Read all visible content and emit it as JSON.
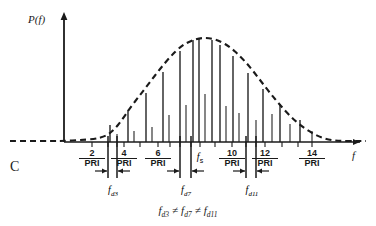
{
  "figure": {
    "panel_label": "C",
    "axis": {
      "y_label": "P(f)",
      "x_label": "f"
    },
    "center_tick": {
      "symbol": "f",
      "subscript": "s"
    },
    "equation": {
      "term1": "f",
      "term1_sub": "d3",
      "op1": "≠",
      "term2": "f",
      "term2_sub": "d7",
      "op2": "≠",
      "term3": "f",
      "term3_sub": "d11"
    },
    "tick_labels": [
      {
        "numerator": "2",
        "denominator": "PRI",
        "x": 92
      },
      {
        "numerator": "4",
        "denominator": "PRI",
        "x": 124
      },
      {
        "numerator": "6",
        "denominator": "PRI",
        "x": 158
      },
      {
        "numerator": "10",
        "denominator": "PRI",
        "x": 232
      },
      {
        "numerator": "12",
        "denominator": "PRI",
        "x": 265
      },
      {
        "numerator": "14",
        "denominator": "PRI",
        "x": 312
      }
    ],
    "doppler_markers": [
      {
        "label": "f",
        "sub": "d3",
        "x": 113,
        "left_rule": 108,
        "right_rule": 117
      },
      {
        "label": "f",
        "sub": "d7",
        "x": 186,
        "left_rule": 180,
        "right_rule": 191
      },
      {
        "label": "f",
        "sub": "d11",
        "x": 252,
        "left_rule": 246,
        "right_rule": 256
      }
    ],
    "colors": {
      "ink": "#1a1a1a",
      "background": "#ffffff"
    }
  },
  "chart_data": {
    "type": "line",
    "title": "",
    "subtitle": "",
    "xlabel": "f",
    "ylabel": "P(f)",
    "grid": false,
    "legend": null,
    "axis_origin_px": {
      "x": 64,
      "y": 142
    },
    "baseline_y_px": 142,
    "xlim_px": [
      10,
      366
    ],
    "ylim_px": [
      14,
      142
    ],
    "envelope": {
      "style": "dashed",
      "points": [
        [
          10,
          141
        ],
        [
          30,
          141
        ],
        [
          50,
          141
        ],
        [
          64,
          141
        ],
        [
          80,
          140
        ],
        [
          95,
          139
        ],
        [
          106,
          136
        ],
        [
          114,
          130
        ],
        [
          122,
          120
        ],
        [
          130,
          108
        ],
        [
          140,
          95
        ],
        [
          150,
          82
        ],
        [
          160,
          69
        ],
        [
          170,
          57
        ],
        [
          180,
          47
        ],
        [
          190,
          41
        ],
        [
          200,
          38
        ],
        [
          210,
          38
        ],
        [
          220,
          41
        ],
        [
          230,
          47
        ],
        [
          240,
          56
        ],
        [
          250,
          67
        ],
        [
          260,
          80
        ],
        [
          270,
          93
        ],
        [
          280,
          105
        ],
        [
          290,
          116
        ],
        [
          300,
          125
        ],
        [
          310,
          132
        ],
        [
          320,
          137
        ],
        [
          330,
          140
        ],
        [
          340,
          141
        ],
        [
          355,
          141
        ],
        [
          366,
          141
        ]
      ]
    },
    "dc_spike": {
      "x": 64,
      "top_y": 14,
      "label": "P(f) axis spike"
    },
    "spectral_lines": [
      {
        "x": 110,
        "top_y": 125,
        "kind": "main"
      },
      {
        "x": 117,
        "top_y": 134,
        "kind": "companion"
      },
      {
        "x": 128,
        "top_y": 110,
        "kind": "main"
      },
      {
        "x": 134,
        "top_y": 131,
        "kind": "companion"
      },
      {
        "x": 146,
        "top_y": 93,
        "kind": "main"
      },
      {
        "x": 152,
        "top_y": 127,
        "kind": "companion"
      },
      {
        "x": 163,
        "top_y": 72,
        "kind": "main"
      },
      {
        "x": 169,
        "top_y": 115,
        "kind": "companion"
      },
      {
        "x": 180,
        "top_y": 51,
        "kind": "main"
      },
      {
        "x": 186,
        "top_y": 105,
        "kind": "companion"
      },
      {
        "x": 193,
        "top_y": 40,
        "kind": "main"
      },
      {
        "x": 199,
        "top_y": 38,
        "kind": "main"
      },
      {
        "x": 205,
        "top_y": 94,
        "kind": "companion"
      },
      {
        "x": 212,
        "top_y": 40,
        "kind": "main"
      },
      {
        "x": 220,
        "top_y": 45,
        "kind": "main"
      },
      {
        "x": 226,
        "top_y": 106,
        "kind": "companion"
      },
      {
        "x": 233,
        "top_y": 56,
        "kind": "main"
      },
      {
        "x": 239,
        "top_y": 113,
        "kind": "companion"
      },
      {
        "x": 248,
        "top_y": 73,
        "kind": "main"
      },
      {
        "x": 256,
        "top_y": 120,
        "kind": "companion"
      },
      {
        "x": 263,
        "top_y": 89,
        "kind": "main"
      },
      {
        "x": 272,
        "top_y": 114,
        "kind": "companion"
      },
      {
        "x": 280,
        "top_y": 104,
        "kind": "main"
      },
      {
        "x": 290,
        "top_y": 124,
        "kind": "companion"
      },
      {
        "x": 300,
        "top_y": 120,
        "kind": "main"
      },
      {
        "x": 312,
        "top_y": 131,
        "kind": "companion"
      }
    ],
    "axis_ticks_px": [
      92,
      108,
      117,
      124,
      140,
      158,
      170,
      180,
      191,
      200,
      215,
      232,
      246,
      256,
      265,
      282,
      298,
      312
    ],
    "tick_categories": [
      "2/PRI",
      "4/PRI",
      "6/PRI",
      "fs",
      "10/PRI",
      "12/PRI",
      "14/PRI"
    ],
    "annotations": [
      "f_d3 ≠ f_d7 ≠ f_d11",
      "panel C"
    ]
  }
}
